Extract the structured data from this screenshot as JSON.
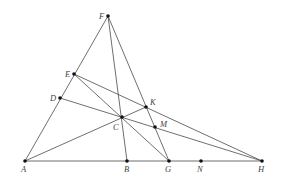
{
  "diagram": {
    "type": "geometry-construction",
    "colors": {
      "line": "#4a4a4a",
      "point": "#111111",
      "label": "#444444",
      "background": "#ffffff"
    },
    "points": [
      {
        "id": "F",
        "label": "F",
        "x": 108,
        "y": 16,
        "lx": 99,
        "ly": 19
      },
      {
        "id": "E",
        "label": "E",
        "x": 74,
        "y": 74,
        "lx": 65,
        "ly": 77
      },
      {
        "id": "D",
        "label": "D",
        "x": 60,
        "y": 98,
        "lx": 50,
        "ly": 101
      },
      {
        "id": "A",
        "label": "A",
        "x": 25,
        "y": 161,
        "lx": 21,
        "ly": 172
      },
      {
        "id": "K",
        "label": "K",
        "x": 146,
        "y": 107,
        "lx": 150,
        "ly": 105
      },
      {
        "id": "C",
        "label": "C",
        "x": 122,
        "y": 117,
        "lx": 113,
        "ly": 130
      },
      {
        "id": "M",
        "label": "M",
        "x": 155,
        "y": 127,
        "lx": 160,
        "ly": 127
      },
      {
        "id": "B",
        "label": "B",
        "x": 127,
        "y": 161,
        "lx": 124,
        "ly": 172
      },
      {
        "id": "G",
        "label": "G",
        "x": 169,
        "y": 161,
        "lx": 165,
        "ly": 172
      },
      {
        "id": "N",
        "label": "N",
        "x": 201,
        "y": 161,
        "lx": 197,
        "ly": 172
      },
      {
        "id": "H",
        "label": "H",
        "x": 262,
        "y": 161,
        "lx": 258,
        "ly": 172
      }
    ],
    "segments": [
      {
        "from": "A",
        "to": "F"
      },
      {
        "from": "A",
        "to": "H"
      },
      {
        "from": "F",
        "to": "B"
      },
      {
        "from": "F",
        "to": "G"
      },
      {
        "from": "E",
        "to": "H"
      },
      {
        "from": "D",
        "to": "H"
      },
      {
        "from": "E",
        "to": "G"
      },
      {
        "from": "A",
        "to": "K"
      }
    ]
  }
}
